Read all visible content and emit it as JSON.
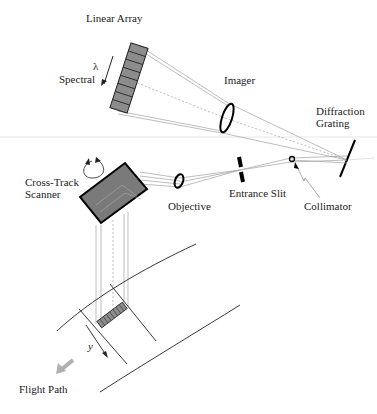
{
  "diagram": {
    "labels": {
      "linear_array": "Linear Array",
      "spectral": "Spectral",
      "lambda": "λ",
      "imager": "Imager",
      "diffraction_grating_1": "Diffraction",
      "diffraction_grating_2": "Grating",
      "cross_track_1": "Cross-Track",
      "cross_track_2": "Scanner",
      "objective": "Objective",
      "entrance_slit": "Entrance Slit",
      "collimator": "Collimator",
      "y_axis": "y",
      "flight_path": "Flight Path"
    },
    "colors": {
      "detector_fill": "#8c8c8c",
      "scanner_fill": "#7a7a7a",
      "ray_line": "#9a9a9a",
      "outline": "#000000",
      "flight_arrow": "#b0b0b0"
    }
  }
}
